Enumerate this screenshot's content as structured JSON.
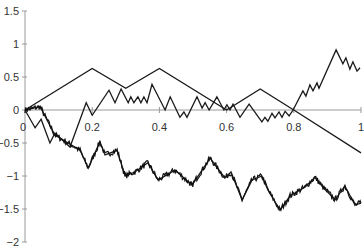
{
  "chart_data": {
    "type": "line",
    "title": "",
    "xlabel": "",
    "ylabel": "",
    "xlim": [
      0,
      1
    ],
    "ylim": [
      -2,
      1.5
    ],
    "grid": false,
    "legend": null,
    "x_ticks": [
      0,
      0.2,
      0.4,
      0.6,
      0.8,
      1
    ],
    "x_tick_labels": [
      "0",
      "0.2",
      "0.4",
      "0.6",
      "0.8",
      "1"
    ],
    "y_ticks": [
      1.5,
      1,
      0.5,
      0,
      -0.5,
      -1,
      -1.5,
      -2
    ],
    "y_tick_labels": [
      "1.5",
      "1",
      "0.5",
      "0",
      "−0.5",
      "−1",
      "−1.5",
      "−2"
    ],
    "series": [
      {
        "name": "coarse random walk (step 0.1)",
        "x": [
          0,
          0.2,
          0.3,
          0.4,
          0.6,
          0.7,
          0.8,
          1.0
        ],
        "y": [
          0,
          0.63,
          0.33,
          0.63,
          0.0,
          0.32,
          0.0,
          -0.65
        ]
      },
      {
        "name": "medium random walk",
        "x": [
          0,
          0.03,
          0.048,
          0.074,
          0.089,
          0.134,
          0.182,
          0.2,
          0.25,
          0.268,
          0.286,
          0.307,
          0.315,
          0.324,
          0.336,
          0.345,
          0.354,
          0.363,
          0.378,
          0.417,
          0.432,
          0.461,
          0.473,
          0.482,
          0.512,
          0.527,
          0.536,
          0.548,
          0.571,
          0.592,
          0.601,
          0.61,
          0.619,
          0.64,
          0.667,
          0.705,
          0.714,
          0.723,
          0.735,
          0.744,
          0.756,
          0.765,
          0.774,
          0.786,
          0.798,
          0.827,
          0.836,
          0.848,
          0.857,
          0.869,
          0.875,
          0.926,
          0.946,
          0.955,
          0.967,
          0.976,
          0.988,
          0.997
        ],
        "y": [
          0,
          -0.27,
          -0.14,
          -0.5,
          -0.35,
          -0.56,
          0.11,
          -0.08,
          0.3,
          0.11,
          0.32,
          0.11,
          0.2,
          0.11,
          0.2,
          0.11,
          0.2,
          0.11,
          0.39,
          0.0,
          0.2,
          -0.11,
          -0.03,
          -0.11,
          0.2,
          0.03,
          0.11,
          0.0,
          0.2,
          0.0,
          0.08,
          0.0,
          0.09,
          -0.11,
          0.09,
          -0.18,
          -0.11,
          -0.17,
          -0.05,
          -0.12,
          -0.03,
          -0.11,
          -0.02,
          -0.09,
          0.0,
          0.29,
          0.21,
          0.38,
          0.29,
          0.41,
          0.33,
          0.91,
          0.7,
          0.79,
          0.62,
          0.73,
          0.59,
          0.64
        ]
      },
      {
        "name": "fine random walk (Brownian-like)",
        "x": [
          0,
          0.045,
          0.089,
          0.164,
          0.188,
          0.223,
          0.238,
          0.274,
          0.298,
          0.327,
          0.366,
          0.396,
          0.446,
          0.491,
          0.497,
          0.551,
          0.595,
          0.613,
          0.646,
          0.676,
          0.705,
          0.723,
          0.759,
          0.789,
          0.833,
          0.863,
          0.887,
          0.923,
          0.952,
          0.982,
          1.0
        ],
        "y": [
          0,
          0.05,
          -0.38,
          -0.61,
          -0.88,
          -0.48,
          -0.68,
          -0.61,
          -1.0,
          -0.94,
          -0.8,
          -1.06,
          -0.91,
          -1.11,
          -1.14,
          -0.73,
          -1.03,
          -0.94,
          -1.36,
          -1.06,
          -1.0,
          -1.21,
          -1.52,
          -1.3,
          -1.17,
          -1.02,
          -1.17,
          -1.36,
          -1.15,
          -1.44,
          -1.41
        ]
      }
    ]
  }
}
